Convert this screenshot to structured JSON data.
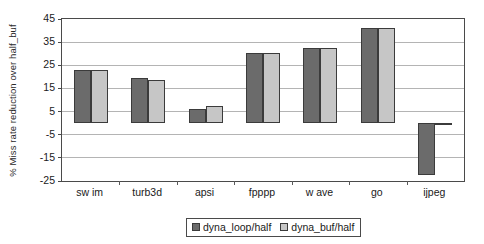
{
  "chart_data": {
    "type": "bar",
    "title": "",
    "xlabel": "",
    "ylabel": "% Miss rate reduction over half_buf",
    "ylim": [
      -25,
      45
    ],
    "ytick_step": 10,
    "yticks": [
      45,
      35,
      25,
      15,
      5,
      -5,
      -15,
      -25
    ],
    "ytick_labels": [
      "45",
      "35",
      "25",
      "15",
      "5",
      "-5",
      "-15",
      "-25"
    ],
    "grid": true,
    "grid_axis": "y",
    "legend_position": "bottom-center",
    "categories": [
      "sw im",
      "turb3d",
      "apsi",
      "fpppp",
      "w ave",
      "go",
      "ijpeg"
    ],
    "series": [
      {
        "name": "dyna_loop/half",
        "color": "#6b6b6b",
        "values": [
          23,
          19.5,
          6,
          30.5,
          32.5,
          41,
          -22.5
        ]
      },
      {
        "name": "dyna_buf/half",
        "color": "#c6c6c6",
        "values": [
          23,
          18.5,
          7.5,
          30.5,
          32.5,
          41,
          -1
        ]
      }
    ]
  },
  "colors": {
    "series_0": "#6b6b6b",
    "series_1": "#c6c6c6",
    "axis": "#4a4a4a",
    "gridline": "#b4b4b4",
    "background": "#ffffff"
  }
}
